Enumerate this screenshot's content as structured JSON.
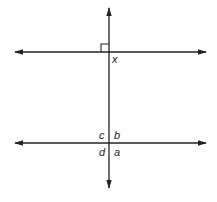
{
  "diagram": {
    "type": "geometry",
    "colors": {
      "line": "#222222",
      "background": "#ffffff"
    },
    "lines": [
      {
        "id": "transversal",
        "orientation": "vertical",
        "arrows": "both"
      },
      {
        "id": "top-line",
        "orientation": "horizontal",
        "arrows": "both"
      },
      {
        "id": "bottom-line",
        "orientation": "horizontal",
        "arrows": "both"
      }
    ],
    "right_angle_marker": {
      "at": "top intersection",
      "quadrant": "upper-left"
    },
    "labels": {
      "x": "x",
      "a": "a",
      "b": "b",
      "c": "c",
      "d": "d"
    }
  }
}
